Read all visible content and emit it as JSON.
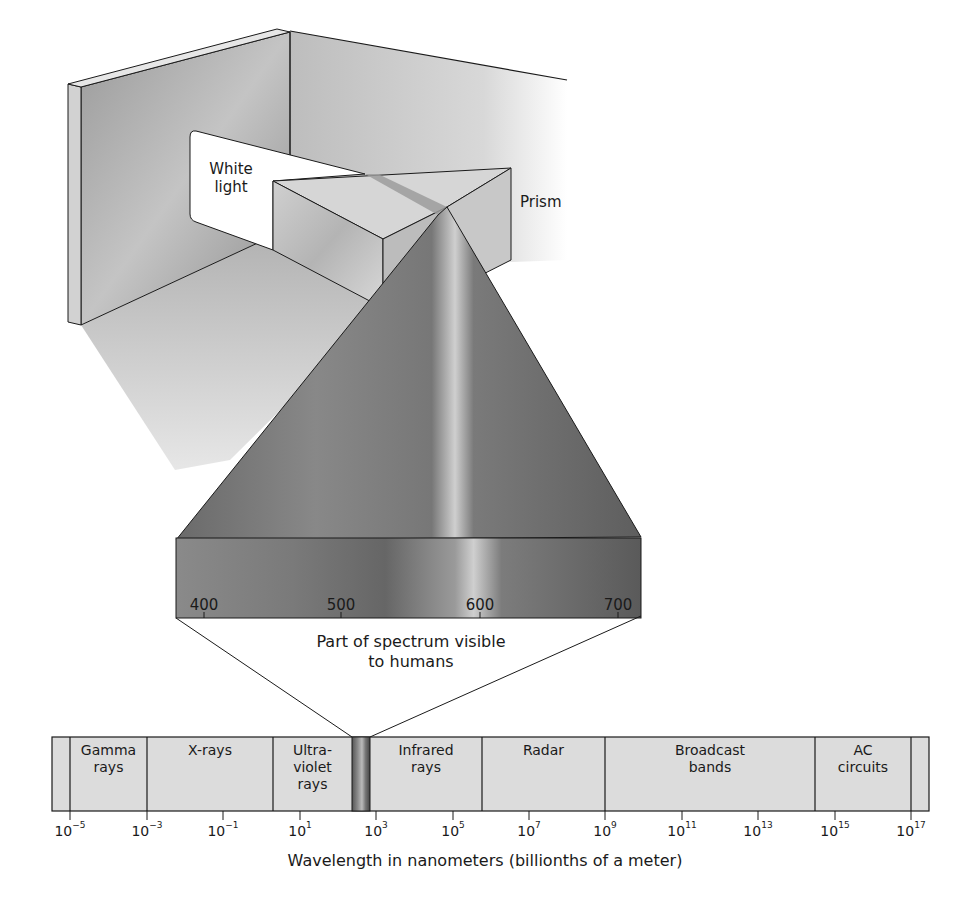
{
  "labels": {
    "white_light": "White\nlight",
    "prism": "Prism",
    "visible_caption_line1": "Part of spectrum visible",
    "visible_caption_line2": "to humans",
    "axis_title": "Wavelength in nanometers (billionths of a meter)"
  },
  "visible_spectrum": {
    "ticks": [
      {
        "value": "400",
        "x": 204
      },
      {
        "value": "500",
        "x": 341
      },
      {
        "value": "600",
        "x": 480
      },
      {
        "value": "700",
        "x": 618
      }
    ]
  },
  "em_spectrum": {
    "bands": [
      {
        "name": "Gamma\nrays",
        "x0": 70,
        "x1": 147
      },
      {
        "name": "X-rays",
        "x0": 147,
        "x1": 273
      },
      {
        "name": "Ultra-\nviolet\nrays",
        "x0": 273,
        "x1": 352
      },
      {
        "name": "Infrared\nrays",
        "x0": 370,
        "x1": 482
      },
      {
        "name": "Radar",
        "x0": 482,
        "x1": 605
      },
      {
        "name": "Broadcast\nbands",
        "x0": 605,
        "x1": 815
      },
      {
        "name": "AC\ncircuits",
        "x0": 815,
        "x1": 911
      }
    ],
    "visible_band": {
      "x0": 352,
      "x1": 370
    },
    "ticks": [
      {
        "base": "10",
        "exp": "−5",
        "x": 70
      },
      {
        "base": "10",
        "exp": "−3",
        "x": 147
      },
      {
        "base": "10",
        "exp": "−1",
        "x": 223
      },
      {
        "base": "10",
        "exp": "1",
        "x": 300
      },
      {
        "base": "10",
        "exp": "3",
        "x": 376
      },
      {
        "base": "10",
        "exp": "5",
        "x": 453
      },
      {
        "base": "10",
        "exp": "7",
        "x": 529
      },
      {
        "base": "10",
        "exp": "9",
        "x": 605
      },
      {
        "base": "10",
        "exp": "11",
        "x": 682
      },
      {
        "base": "10",
        "exp": "13",
        "x": 758
      },
      {
        "base": "10",
        "exp": "15",
        "x": 835
      },
      {
        "base": "10",
        "exp": "17",
        "x": 911
      }
    ]
  },
  "colors": {
    "band_fill": "#dcdcdc",
    "outline": "#1a1a1a",
    "spectrum_dark": "#5c5c5c",
    "spectrum_light": "#b8b8b8"
  }
}
